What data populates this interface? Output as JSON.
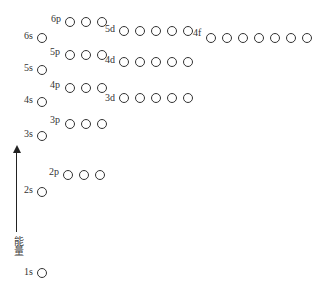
{
  "axis": {
    "label": "能量",
    "direction": "up"
  },
  "levels": [
    {
      "name": "1s",
      "label_x": 24,
      "label_y": 267,
      "orb_x": [
        37
      ],
      "orb_y": 268,
      "count": 1
    },
    {
      "name": "2s",
      "label_x": 24,
      "label_y": 185,
      "orb_x": [
        37
      ],
      "orb_y": 187,
      "count": 1
    },
    {
      "name": "2p",
      "label_x": 49,
      "label_y": 167,
      "orb_x": [
        63,
        79,
        95
      ],
      "orb_y": 170,
      "count": 3
    },
    {
      "name": "3s",
      "label_x": 24,
      "label_y": 129,
      "orb_x": [
        37
      ],
      "orb_y": 131,
      "count": 1
    },
    {
      "name": "3p",
      "label_x": 50,
      "label_y": 115,
      "orb_x": [
        65,
        81,
        97
      ],
      "orb_y": 119,
      "count": 3
    },
    {
      "name": "4s",
      "label_x": 24,
      "label_y": 95,
      "orb_x": [
        37
      ],
      "orb_y": 97,
      "count": 1
    },
    {
      "name": "4p",
      "label_x": 50,
      "label_y": 80,
      "orb_x": [
        65,
        81,
        97
      ],
      "orb_y": 83,
      "count": 3
    },
    {
      "name": "3d",
      "label_x": 105,
      "label_y": 93,
      "orb_x": [
        119,
        135,
        151,
        167,
        183
      ],
      "orb_y": 93,
      "count": 5
    },
    {
      "name": "5s",
      "label_x": 24,
      "label_y": 63,
      "orb_x": [
        37
      ],
      "orb_y": 65,
      "count": 1
    },
    {
      "name": "5p",
      "label_x": 50,
      "label_y": 47,
      "orb_x": [
        65,
        81,
        97
      ],
      "orb_y": 50,
      "count": 3
    },
    {
      "name": "4d",
      "label_x": 105,
      "label_y": 55,
      "orb_x": [
        119,
        135,
        151,
        167,
        183
      ],
      "orb_y": 57,
      "count": 5
    },
    {
      "name": "6s",
      "label_x": 24,
      "label_y": 31,
      "orb_x": [
        37
      ],
      "orb_y": 33,
      "count": 1
    },
    {
      "name": "6p",
      "label_x": 51,
      "label_y": 14,
      "orb_x": [
        65,
        81,
        97
      ],
      "orb_y": 17,
      "count": 3
    },
    {
      "name": "5d",
      "label_x": 105,
      "label_y": 24,
      "orb_x": [
        119,
        135,
        151,
        167,
        183
      ],
      "orb_y": 26,
      "count": 5
    },
    {
      "name": "4f",
      "label_x": 193,
      "label_y": 28,
      "orb_x": [
        206,
        222,
        238,
        254,
        270,
        286,
        302
      ],
      "orb_y": 33,
      "count": 7
    }
  ]
}
